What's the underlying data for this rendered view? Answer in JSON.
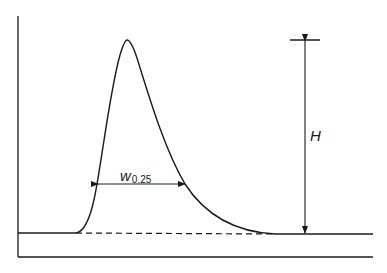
{
  "diagram": {
    "type": "chromatographic-peak",
    "labels": {
      "width_symbol": "w",
      "width_subscript": "0.25",
      "height_symbol": "H"
    },
    "width_level_fraction_of_height": 0.25,
    "colors": {
      "line": "#1a1a1a",
      "background": "#ffffff"
    }
  }
}
